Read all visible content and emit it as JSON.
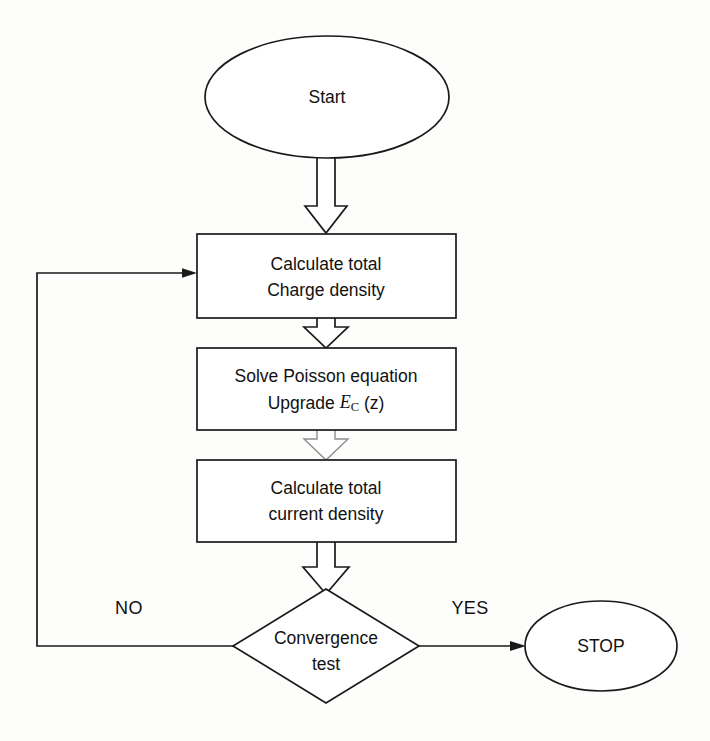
{
  "diagram": {
    "background_color": "#fdfdfc",
    "line_color": "#1a1a1a",
    "fill_color": "#ffffff",
    "nodes": {
      "start": {
        "label": "Start",
        "shape": "ellipse",
        "cx": 327,
        "cy": 97,
        "rx": 122,
        "ry": 61
      },
      "charge": {
        "line1": "Calculate total",
        "line2": "Charge density",
        "shape": "rectangle",
        "x": 197,
        "y": 234,
        "w": 259,
        "h": 84
      },
      "poisson": {
        "line1": "Solve Poisson equation",
        "line2_prefix": "Upgrade ",
        "line2_symbol": "E",
        "line2_subscript": "C",
        "line2_suffix": " (z)",
        "shape": "rectangle",
        "x": 197,
        "y": 348,
        "w": 259,
        "h": 82
      },
      "current": {
        "line1": "Calculate total",
        "line2": "current density",
        "shape": "rectangle",
        "x": 197,
        "y": 460,
        "w": 259,
        "h": 82
      },
      "decision": {
        "line1": "Convergence",
        "line2": "test",
        "shape": "diamond",
        "cx": 326,
        "cy": 646,
        "rx": 93,
        "ry": 57
      },
      "stop": {
        "label": "STOP",
        "shape": "ellipse",
        "cx": 601,
        "cy": 646,
        "rx": 76,
        "ry": 45
      }
    },
    "edges": {
      "start_to_charge": {
        "style": "block-arrow",
        "from": "start",
        "to": "charge"
      },
      "charge_to_poisson": {
        "style": "block-arrow",
        "from": "charge",
        "to": "poisson"
      },
      "poisson_to_current": {
        "style": "block-arrow",
        "from": "poisson",
        "to": "current",
        "faded": true
      },
      "current_to_decision": {
        "style": "block-arrow",
        "from": "current",
        "to": "decision"
      },
      "decision_no": {
        "style": "line-arrow",
        "label": "NO",
        "from": "decision",
        "to": "charge"
      },
      "decision_yes": {
        "style": "line-arrow",
        "label": "YES",
        "from": "decision",
        "to": "stop"
      }
    },
    "labels": {
      "no": "NO",
      "yes": "YES"
    }
  }
}
